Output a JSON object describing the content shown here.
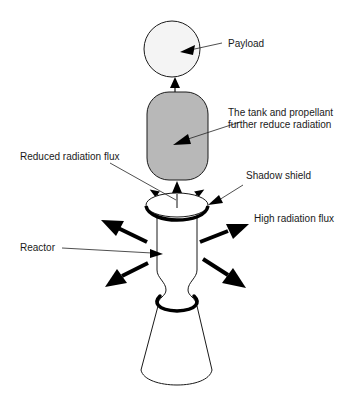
{
  "diagram": {
    "components": {
      "payload": "Payload",
      "tank": "Propellant tank",
      "shield": "Shadow shield",
      "reactor": "Reactor",
      "nozzle": "Nozzle"
    },
    "labels": {
      "payload": "Payload",
      "tank_line1": "The tank and propellant",
      "tank_line2": "further reduce radiation",
      "reduced_flux": "Reduced radiation flux",
      "shadow_shield": "Shadow shield",
      "high_flux": "High radiation flux",
      "reactor": "Reactor"
    },
    "colors": {
      "payload_fill": "#f4f4f4",
      "tank_fill": "#b8b8b8",
      "line": "#1a1a1a",
      "background": "#ffffff"
    }
  }
}
